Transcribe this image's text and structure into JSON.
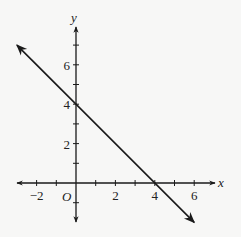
{
  "chart_data": {
    "type": "line",
    "title": "",
    "xlabel": "x",
    "ylabel": "y",
    "origin_label": "O",
    "xlim": [
      -3,
      7
    ],
    "ylim": [
      -2,
      8
    ],
    "grid": false,
    "x_ticks": [
      -2,
      -1,
      0,
      1,
      2,
      3,
      4,
      5,
      6
    ],
    "x_tick_labels": [
      {
        "value": -2,
        "label": "−2"
      },
      {
        "value": 2,
        "label": "2"
      },
      {
        "value": 4,
        "label": "4"
      },
      {
        "value": 6,
        "label": "6"
      }
    ],
    "y_ticks": [
      -1,
      1,
      2,
      3,
      4,
      5,
      6,
      7
    ],
    "y_tick_labels": [
      {
        "value": 2,
        "label": "2"
      },
      {
        "value": 4,
        "label": "4"
      },
      {
        "value": 6,
        "label": "6"
      }
    ],
    "series": [
      {
        "name": "line",
        "equation": "y = -x + 4",
        "x": [
          -3,
          6
        ],
        "y": [
          7,
          -2
        ],
        "arrows": "both",
        "intercepts": {
          "y_intercept": [
            0,
            4
          ],
          "x_intercept": [
            4,
            0
          ]
        }
      }
    ]
  },
  "colors": {
    "background": "#f7f7f6",
    "ink": "#1a1a1a"
  }
}
